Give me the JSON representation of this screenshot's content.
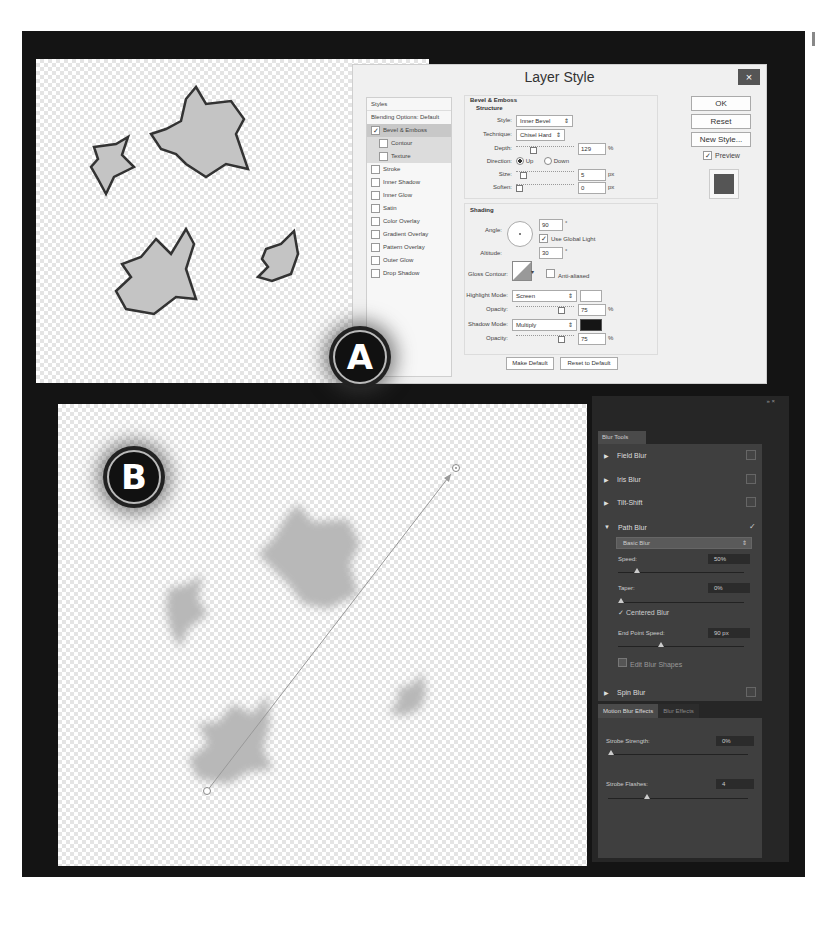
{
  "panels": {
    "a": {
      "badge": "A"
    },
    "b": {
      "badge": "B"
    }
  },
  "layer_style": {
    "title": "Layer Style",
    "close_icon": "×",
    "styles_header": "Styles",
    "styles": [
      {
        "label": "Blending Options: Default",
        "checked": null,
        "selected": false,
        "sub": false
      },
      {
        "label": "Bevel & Emboss",
        "checked": true,
        "selected": true,
        "sub": false
      },
      {
        "label": "Contour",
        "checked": false,
        "selected": false,
        "sub": true
      },
      {
        "label": "Texture",
        "checked": false,
        "selected": false,
        "sub": true
      },
      {
        "label": "Stroke",
        "checked": false,
        "selected": false,
        "sub": false
      },
      {
        "label": "Inner Shadow",
        "checked": false,
        "selected": false,
        "sub": false
      },
      {
        "label": "Inner Glow",
        "checked": false,
        "selected": false,
        "sub": false
      },
      {
        "label": "Satin",
        "checked": false,
        "selected": false,
        "sub": false
      },
      {
        "label": "Color Overlay",
        "checked": false,
        "selected": false,
        "sub": false
      },
      {
        "label": "Gradient Overlay",
        "checked": false,
        "selected": false,
        "sub": false
      },
      {
        "label": "Pattern Overlay",
        "checked": false,
        "selected": false,
        "sub": false
      },
      {
        "label": "Outer Glow",
        "checked": false,
        "selected": false,
        "sub": false
      },
      {
        "label": "Drop Shadow",
        "checked": false,
        "selected": false,
        "sub": false
      }
    ],
    "section_title": "Bevel & Emboss",
    "structure": {
      "title": "Structure",
      "style_label": "Style:",
      "style_value": "Inner Bevel",
      "technique_label": "Technique:",
      "technique_value": "Chisel Hard",
      "depth_label": "Depth:",
      "depth_value": "129",
      "depth_unit": "%",
      "direction_label": "Direction:",
      "direction_up": "Up",
      "direction_down": "Down",
      "size_label": "Size:",
      "size_value": "5",
      "size_unit": "px",
      "soften_label": "Soften:",
      "soften_value": "0",
      "soften_unit": "px"
    },
    "shading": {
      "title": "Shading",
      "angle_label": "Angle:",
      "angle_value": "90",
      "angle_unit": "°",
      "global_light_label": "Use Global Light",
      "altitude_label": "Altitude:",
      "altitude_value": "30",
      "altitude_unit": "°",
      "gloss_label": "Gloss Contour:",
      "anti_aliased_label": "Anti-aliased",
      "highlight_mode_label": "Highlight Mode:",
      "highlight_mode_value": "Screen",
      "highlight_opacity_label": "Opacity:",
      "highlight_opacity_value": "75",
      "highlight_opacity_unit": "%",
      "shadow_mode_label": "Shadow Mode:",
      "shadow_mode_value": "Multiply",
      "shadow_opacity_label": "Opacity:",
      "shadow_opacity_value": "75",
      "shadow_opacity_unit": "%"
    },
    "make_default": "Make Default",
    "reset_default": "Reset to Default",
    "ok": "OK",
    "reset": "Reset",
    "new_style": "New Style...",
    "preview_label": "Preview"
  },
  "blur_tools": {
    "topbar": "»  ×",
    "tab": "Blur Tools",
    "items": [
      {
        "label": "Field Blur",
        "expanded": false,
        "checked": false
      },
      {
        "label": "Iris Blur",
        "expanded": false,
        "checked": false
      },
      {
        "label": "Tilt-Shift",
        "expanded": false,
        "checked": false
      },
      {
        "label": "Path Blur",
        "expanded": true,
        "checked": true
      },
      {
        "label": "Spin Blur",
        "expanded": false,
        "checked": false
      }
    ],
    "path_blur": {
      "preset": "Basic Blur",
      "speed_label": "Speed:",
      "speed_value": "50%",
      "taper_label": "Taper:",
      "taper_value": "0%",
      "centered_label": "Centered Blur",
      "end_speed_label": "End Point Speed:",
      "end_speed_value": "90 px",
      "edit_shapes_label": "Edit Blur Shapes"
    },
    "effects_tabs": [
      "Motion Blur Effects",
      "Blur Effects"
    ],
    "strobe_strength_label": "Strobe Strength:",
    "strobe_strength_value": "0%",
    "strobe_flashes_label": "Strobe Flashes:",
    "strobe_flashes_value": "4"
  },
  "colors": {
    "frame": "#141414",
    "panel_dark": "#262626",
    "panel_body": "#3f3f3f",
    "dialog": "#f0f0f0"
  }
}
